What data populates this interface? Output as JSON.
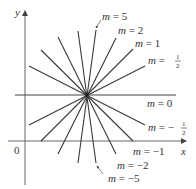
{
  "figure": {
    "axes": {
      "x_label": "x",
      "y_label": "y",
      "origin_label": "0",
      "color": "#555555"
    },
    "line_color": "#3a3a3a",
    "center": {
      "x": 87,
      "y": 95
    },
    "lines": [
      {
        "slope": "5",
        "x1": 96,
        "y1": 30,
        "x2": 78,
        "y2": 163
      },
      {
        "slope": "2",
        "x1": 116,
        "y1": 38,
        "x2": 58,
        "y2": 154
      },
      {
        "slope": "1",
        "x1": 133,
        "y1": 49,
        "x2": 41,
        "y2": 141
      },
      {
        "slope": "1/2",
        "x1": 145,
        "y1": 66,
        "x2": 29,
        "y2": 125
      },
      {
        "slope": "0",
        "x1": 15,
        "y1": 95,
        "x2": 176,
        "y2": 95
      },
      {
        "slope": "-1/2",
        "x1": 29,
        "y1": 66,
        "x2": 145,
        "y2": 125
      },
      {
        "slope": "-1",
        "x1": 41,
        "y1": 50,
        "x2": 133,
        "y2": 141
      },
      {
        "slope": "-2",
        "x1": 58,
        "y1": 37,
        "x2": 116,
        "y2": 154
      },
      {
        "slope": "-5",
        "x1": 78,
        "y1": 31,
        "x2": 96,
        "y2": 163
      }
    ],
    "labels": {
      "m5": {
        "prefix": "m = ",
        "value": "5"
      },
      "m2": {
        "prefix": "m = ",
        "value": "2"
      },
      "m1": {
        "prefix": "m = ",
        "value": "1"
      },
      "mhalf": {
        "prefix": "m = ",
        "num": "1",
        "den": "2"
      },
      "m0": {
        "prefix": "m = ",
        "value": "0"
      },
      "mneghalf": {
        "prefix": "m = −",
        "num": "1",
        "den": "2"
      },
      "mneg1": {
        "prefix": "m = ",
        "value": "−1"
      },
      "mneg2": {
        "prefix": "m = ",
        "value": "−2"
      },
      "mneg5": {
        "prefix": "m = ",
        "value": "−5"
      }
    }
  }
}
